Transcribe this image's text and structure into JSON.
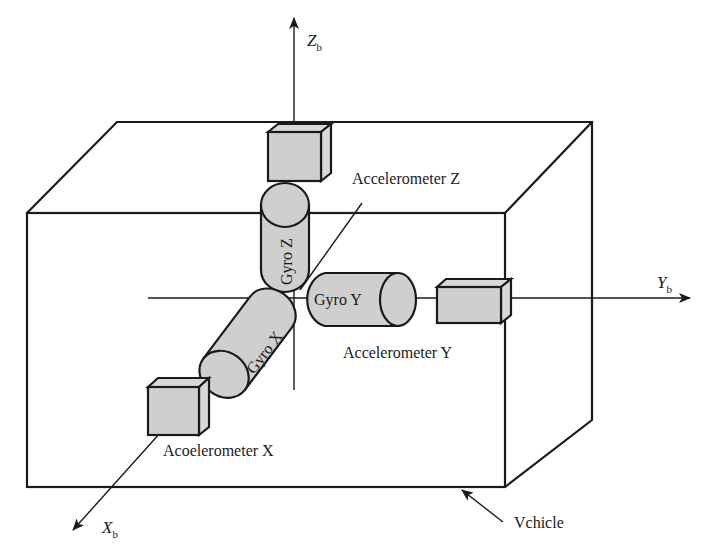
{
  "figure": {
    "type": "imu-strapdown-diagram",
    "colors": {
      "stroke": "#1a1a1a",
      "component_fill": "#cfcfcf",
      "background": "#ffffff"
    }
  },
  "axes": {
    "z": {
      "label": "Z",
      "subscript": "b"
    },
    "y": {
      "label": "Y",
      "subscript": "b"
    },
    "x": {
      "label": "X",
      "subscript": "b"
    }
  },
  "components": {
    "accel_z": "Accelerometer Z",
    "accel_y": "Accelerometer Y",
    "accel_x": "Acoelerometer X",
    "gyro_z": "Gyro Z",
    "gyro_y": "Gyro Y",
    "gyro_x": "Gyro X"
  },
  "vehicle": {
    "label": "Vchicle"
  }
}
